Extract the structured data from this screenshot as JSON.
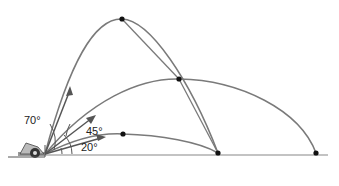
{
  "diagram": {
    "angles": [
      {
        "label": "70°",
        "value": 70
      },
      {
        "label": "45°",
        "value": 45
      },
      {
        "label": "20°",
        "value": 20
      }
    ],
    "colors": {
      "trajectory": "#7a7a7a",
      "ground": "#888888",
      "point": "#111111",
      "text": "#222222"
    }
  }
}
